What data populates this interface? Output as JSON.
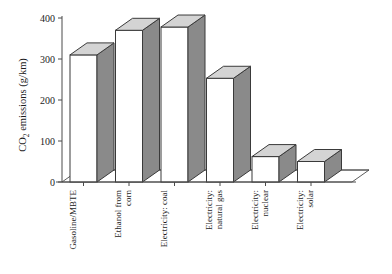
{
  "chart_data": {
    "type": "bar",
    "title": "",
    "xlabel": "",
    "ylabel": "CO2 emissions (g/km)",
    "ylabel_parts": {
      "pre": "CO",
      "sub": "2",
      "post": " emissions (g/km)"
    },
    "categories": [
      "Gasoline/MBTE",
      "Ethanol from corn",
      "Electricity: coal",
      "Electricity: natural gas",
      "Electricity: nuclear",
      "Electricity: solar"
    ],
    "category_lines": [
      [
        "Gasoline/MBTE"
      ],
      [
        "Ethanol from",
        "corn"
      ],
      [
        "Electricity: coal"
      ],
      [
        "Electricity:",
        "natural gas"
      ],
      [
        "Electricity:",
        "nuclear"
      ],
      [
        "Electricity:",
        "solar"
      ]
    ],
    "values": [
      310,
      370,
      378,
      253,
      62,
      50
    ],
    "ylim": [
      0,
      400
    ],
    "yticks": [
      0,
      100,
      200,
      300,
      400
    ],
    "ytick_labels": [
      "0",
      "100",
      "200",
      "300",
      "400"
    ],
    "grid": false,
    "legend": null,
    "style": "3d-column",
    "colors": {
      "bar_front": "#ffffff",
      "bar_side": "#8a8a8a",
      "bar_top": "#d4d4d4",
      "outline": "#3a3a3a",
      "axis": "#4a4a4a",
      "text": "#1c1c1c",
      "background": "#ffffff"
    }
  }
}
